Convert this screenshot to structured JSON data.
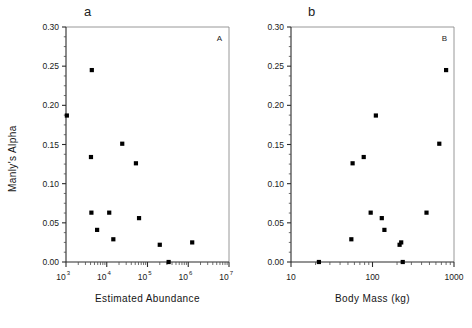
{
  "figure": {
    "panel_a_letter": "a",
    "panel_b_letter": "b",
    "caption_ghost": ""
  },
  "chart_data": [
    {
      "id": "panel_a",
      "type": "scatter",
      "title": "a",
      "corner_label": "A",
      "xlabel": "Estimated Abundance",
      "ylabel": "Manly's Alpha",
      "xscale": "log",
      "yscale": "linear",
      "xlim": [
        1000,
        10000000
      ],
      "ylim": [
        0.0,
        0.3
      ],
      "xticks": [
        1000,
        10000,
        100000,
        1000000,
        10000000
      ],
      "xticklabels": [
        "10^3",
        "10^4",
        "10^5",
        "10^6",
        "10^7"
      ],
      "xtick_bases": [
        "10",
        "10",
        "10",
        "10",
        "10"
      ],
      "xtick_exps": [
        "3",
        "4",
        "5",
        "6",
        "7"
      ],
      "yticks": [
        0.0,
        0.05,
        0.1,
        0.15,
        0.2,
        0.25,
        0.3
      ],
      "yticklabels": [
        "0.00",
        "0.05",
        "0.10",
        "0.15",
        "0.20",
        "0.25",
        "0.30"
      ],
      "grid": false,
      "legend": "none",
      "marker": "filled-square",
      "marker_color": "#000000",
      "x": [
        1050,
        4300,
        4100,
        24000,
        52000,
        4200,
        11500,
        5800,
        14500,
        62000,
        200000,
        330000,
        1250000
      ],
      "y": [
        0.187,
        0.245,
        0.134,
        0.151,
        0.126,
        0.063,
        0.063,
        0.041,
        0.029,
        0.056,
        0.022,
        0.0,
        0.025
      ]
    },
    {
      "id": "panel_b",
      "type": "scatter",
      "title": "b",
      "corner_label": "B",
      "xlabel": "Body Mass (kg)",
      "ylabel": "Manly's Alpha",
      "xscale": "log",
      "yscale": "linear",
      "xlim": [
        10,
        1000
      ],
      "ylim": [
        0.0,
        0.3
      ],
      "xticks": [
        10,
        100,
        1000
      ],
      "xticklabels": [
        "10",
        "100",
        "1000"
      ],
      "yticks": [
        0.0,
        0.05,
        0.1,
        0.15,
        0.2,
        0.25,
        0.3
      ],
      "yticklabels": [
        "0.00",
        "0.05",
        "0.10",
        "0.15",
        "0.20",
        "0.25",
        "0.30"
      ],
      "grid": false,
      "legend": "none",
      "marker": "filled-square",
      "marker_color": "#000000",
      "x": [
        22,
        55,
        57,
        78,
        95,
        110,
        130,
        140,
        215,
        225,
        235,
        460,
        660,
        800
      ],
      "y": [
        0.0,
        0.029,
        0.126,
        0.134,
        0.063,
        0.187,
        0.056,
        0.041,
        0.022,
        0.025,
        0.0,
        0.063,
        0.151,
        0.245
      ]
    }
  ]
}
